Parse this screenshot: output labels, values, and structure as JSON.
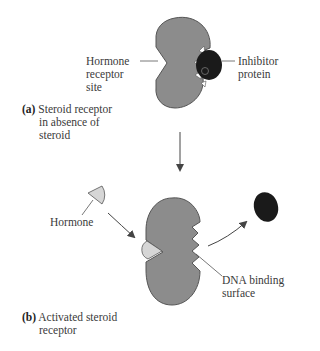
{
  "colors": {
    "receptor_fill": "#8c8c8c",
    "receptor_stroke": "#555555",
    "inhibitor_fill": "#1a1a1a",
    "hormone_fill": "#d6d6d6",
    "arrow": "#444444"
  },
  "panel_a": {
    "letter": "(a)",
    "caption_lines": [
      "Steroid receptor",
      "in absence of",
      "steroid"
    ],
    "labels": {
      "hormone_receptor_site": [
        "Hormone",
        "receptor",
        "site"
      ],
      "inhibitor_protein": [
        "Inhibitor",
        "protein"
      ]
    }
  },
  "panel_b": {
    "letter": "(b)",
    "caption_lines": [
      "Activated steroid",
      "receptor"
    ],
    "labels": {
      "hormone": "Hormone",
      "dna_binding_surface": [
        "DNA binding",
        "surface"
      ]
    }
  }
}
